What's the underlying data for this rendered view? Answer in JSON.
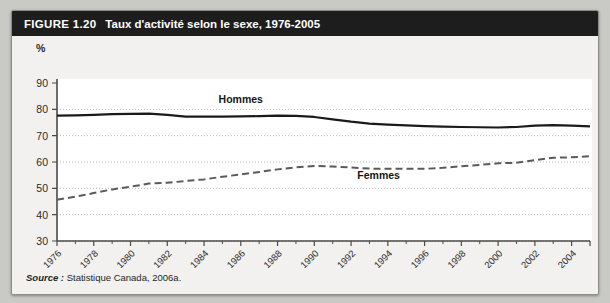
{
  "figure": {
    "label": "FIGURE 1.20",
    "title": "Taux d'activité selon le sexe, 1976-2005",
    "source_label": "Source :",
    "source_text": "Statistique Canada, 2006a."
  },
  "chart_data": {
    "type": "line",
    "title": "Taux d'activité selon le sexe, 1976-2005",
    "xlabel": "",
    "ylabel": "%",
    "ylim": [
      30,
      90
    ],
    "yticks": [
      30,
      40,
      50,
      60,
      70,
      80,
      90
    ],
    "xlim": [
      1976,
      2005
    ],
    "xticks": [
      1976,
      1978,
      1980,
      1982,
      1984,
      1986,
      1988,
      1990,
      1992,
      1994,
      1996,
      1998,
      2000,
      2002,
      2004
    ],
    "xtick_labels": [
      "1976",
      "1978",
      "1980",
      "1982",
      "1984",
      "1986",
      "1988",
      "1990",
      "1992",
      "1994",
      "1996",
      "1998",
      "2000",
      "2002",
      "2004"
    ],
    "grid": true,
    "legend": "inline-annotations",
    "x": [
      1976,
      1977,
      1978,
      1979,
      1980,
      1981,
      1982,
      1983,
      1984,
      1985,
      1986,
      1987,
      1988,
      1989,
      1990,
      1991,
      1992,
      1993,
      1994,
      1995,
      1996,
      1997,
      1998,
      1999,
      2000,
      2001,
      2002,
      2003,
      2004,
      2005
    ],
    "series": [
      {
        "name": "Hommes",
        "style": "solid",
        "color": "#1a1a1a",
        "values": [
          77.6,
          77.7,
          77.9,
          78.2,
          78.3,
          78.4,
          77.9,
          77.2,
          77.2,
          77.2,
          77.3,
          77.4,
          77.6,
          77.5,
          77.1,
          76.2,
          75.3,
          74.6,
          74.2,
          73.9,
          73.6,
          73.4,
          73.3,
          73.2,
          73.1,
          73.3,
          73.8,
          74.0,
          73.8,
          73.5
        ]
      },
      {
        "name": "Femmes",
        "style": "dashed",
        "color": "#5a5a5a",
        "values": [
          45.7,
          46.8,
          48.2,
          49.6,
          50.6,
          51.8,
          52.1,
          52.8,
          53.4,
          54.4,
          55.3,
          56.2,
          57.2,
          58.0,
          58.5,
          58.3,
          57.9,
          57.5,
          57.4,
          57.4,
          57.4,
          57.8,
          58.4,
          58.9,
          59.5,
          59.7,
          60.7,
          61.6,
          61.8,
          62.2
        ]
      }
    ],
    "annotations": [
      {
        "text": "Hommes",
        "x": 1986,
        "y": 82.5
      },
      {
        "text": "Femmes",
        "x": 1993.5,
        "y": 53.5
      }
    ]
  }
}
